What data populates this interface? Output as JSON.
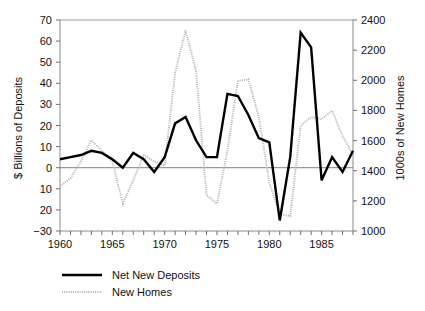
{
  "chart_data": {
    "type": "line",
    "title": "",
    "subtitle": "",
    "xlabel": "",
    "ylabel": "$ Billions of Deposits",
    "y2label": "1000s of New Homes",
    "grid": false,
    "legend_position": "bottom-left",
    "xlim": [
      1960,
      1988
    ],
    "ylim": [
      -30,
      70
    ],
    "y2lim": [
      1000,
      2400
    ],
    "x_tick_interval": 1,
    "x_labeled_ticks": [
      "1960",
      "1965",
      "1970",
      "1975",
      "1980",
      "1985"
    ],
    "x_labeled_values": [
      1960,
      1965,
      1970,
      1975,
      1980,
      1985
    ],
    "y_ticks": [
      -30,
      -20,
      -10,
      0,
      10,
      20,
      30,
      40,
      50,
      60,
      70
    ],
    "y_tick_labels": [
      "−30",
      "20",
      "10",
      "0",
      "10",
      "20",
      "30",
      "40",
      "50",
      "60",
      "70"
    ],
    "y2_ticks": [
      1000,
      1200,
      1400,
      1600,
      1800,
      2000,
      2200,
      2400
    ],
    "y2_tick_labels": [
      "1000",
      "1200",
      "1400",
      "1600",
      "1800",
      "2000",
      "2200",
      "2400"
    ],
    "x": [
      1960,
      1961,
      1962,
      1963,
      1964,
      1965,
      1966,
      1967,
      1968,
      1969,
      1970,
      1971,
      1972,
      1973,
      1974,
      1975,
      1976,
      1977,
      1978,
      1979,
      1980,
      1981,
      1982,
      1983,
      1984,
      1985,
      1986,
      1987,
      1988
    ],
    "series": [
      {
        "name": "Net New Deposits",
        "axis": "left",
        "style": "solid",
        "color": "#000000",
        "units": "$ Billions",
        "values": [
          4,
          5,
          6,
          8,
          7,
          4,
          0,
          7,
          4,
          -2,
          5,
          21,
          24,
          13,
          5,
          5,
          35,
          34,
          25,
          14,
          12,
          -25,
          5,
          64,
          57,
          -6,
          5,
          -2,
          8
        ]
      },
      {
        "name": "New Homes",
        "axis": "right",
        "style": "dotted",
        "color": "#b8b8b8",
        "units": "1000s of Homes",
        "values": [
          1290,
          1370,
          1470,
          1600,
          1530,
          1470,
          1180,
          1320,
          1520,
          1480,
          1440,
          2050,
          2340,
          2060,
          1340,
          1180,
          1540,
          1990,
          2010,
          1750,
          1300,
          1090,
          1080,
          1700,
          1750,
          1740,
          1790,
          1620,
          1490
        ],
        "values_left_scale": [
          -9,
          -5,
          3,
          13,
          8,
          3,
          -17,
          -6,
          6,
          3,
          1,
          45,
          65,
          46,
          -13,
          -17,
          8,
          41,
          42,
          24,
          -7,
          -22,
          -23,
          20,
          24,
          23,
          27,
          15,
          6
        ]
      }
    ],
    "legend": [
      {
        "label": "Net New Deposits",
        "style": "solid",
        "color": "#000000"
      },
      {
        "label": "New Homes",
        "style": "dotted",
        "color": "#b8b8b8"
      }
    ]
  },
  "axes": {
    "left_title": "$ Billions of Deposits",
    "right_title": "1000s of New Homes"
  }
}
